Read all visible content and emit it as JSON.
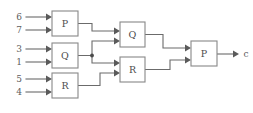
{
  "diagram": {
    "type": "block-diagram",
    "background_color": "#ffffff",
    "line_color": "#6b6b6b",
    "box_border_color": "#888888",
    "box_fill_color": "#ffffff",
    "text_color": "#4d4d4d",
    "inputs": [
      {
        "id": "in-6",
        "label": "6"
      },
      {
        "id": "in-7",
        "label": "7"
      },
      {
        "id": "in-3",
        "label": "3"
      },
      {
        "id": "in-1",
        "label": "1"
      },
      {
        "id": "in-5",
        "label": "5"
      },
      {
        "id": "in-4",
        "label": "4"
      }
    ],
    "blocks": [
      {
        "id": "block-p1",
        "label": "P",
        "stage": 1
      },
      {
        "id": "block-q1",
        "label": "Q",
        "stage": 1
      },
      {
        "id": "block-r1",
        "label": "R",
        "stage": 1
      },
      {
        "id": "block-q2",
        "label": "Q",
        "stage": 2
      },
      {
        "id": "block-r2",
        "label": "R",
        "stage": 2
      },
      {
        "id": "block-p3",
        "label": "P",
        "stage": 3
      }
    ],
    "outputs": [
      {
        "id": "out-c",
        "label": "c"
      }
    ]
  }
}
